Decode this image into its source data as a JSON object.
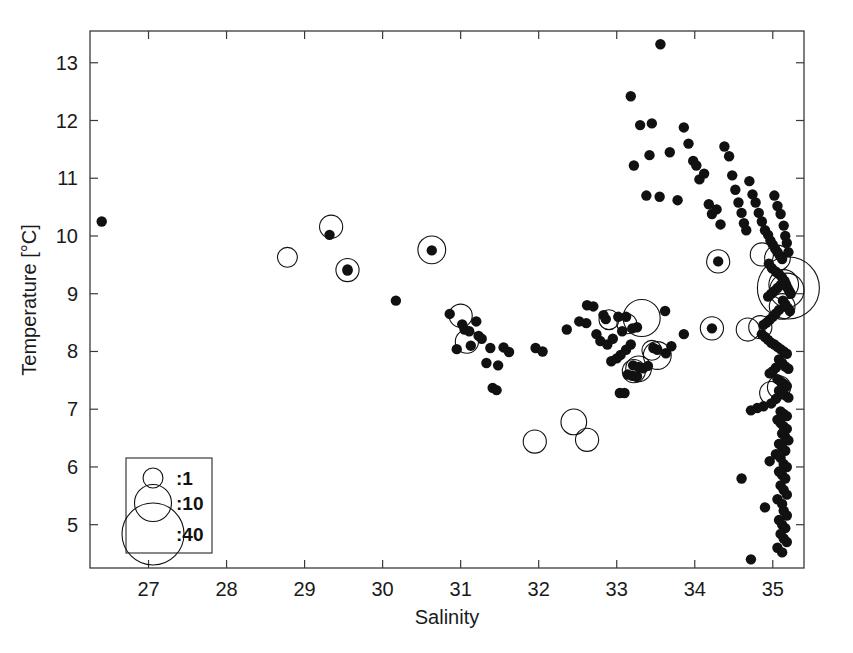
{
  "chart_data": {
    "type": "scatter",
    "title": "",
    "xlabel": "Salinity",
    "ylabel": "Temperature [°C]",
    "xlim": [
      26.25,
      35.4
    ],
    "ylim": [
      4.25,
      13.55
    ],
    "xticks": [
      27,
      28,
      29,
      30,
      31,
      32,
      33,
      34,
      35
    ],
    "yticks": [
      5,
      6,
      7,
      8,
      9,
      10,
      11,
      12,
      13
    ],
    "xticklabels": [
      "27",
      "28",
      "29",
      "30",
      "31",
      "32",
      "33",
      "34",
      "35"
    ],
    "yticklabels": [
      "5",
      "6",
      "7",
      "8",
      "9",
      "10",
      "11",
      "12",
      "13"
    ],
    "grid": false,
    "legend": {
      "position": "lower-left",
      "title": "",
      "entries": [
        {
          "label": ":1",
          "size_value": 1,
          "marker": "open-circle"
        },
        {
          "label": ":10",
          "size_value": 10,
          "marker": "open-circle"
        },
        {
          "label": ":40",
          "size_value": 40,
          "marker": "open-circle"
        }
      ]
    },
    "series": [
      {
        "name": "filled-observations",
        "marker": "filled-circle",
        "color": "#111111",
        "points": [
          [
            26.4,
            10.25
          ],
          [
            29.32,
            10.02
          ],
          [
            29.55,
            9.4
          ],
          [
            29.55,
            9.42
          ],
          [
            30.17,
            8.88
          ],
          [
            30.63,
            9.75
          ],
          [
            30.86,
            8.65
          ],
          [
            31.02,
            8.47
          ],
          [
            31.05,
            8.38
          ],
          [
            31.13,
            8.1
          ],
          [
            31.23,
            8.27
          ],
          [
            31.27,
            8.22
          ],
          [
            31.2,
            8.52
          ],
          [
            31.11,
            8.35
          ],
          [
            31.38,
            8.06
          ],
          [
            31.33,
            7.8
          ],
          [
            31.48,
            7.76
          ],
          [
            31.41,
            7.37
          ],
          [
            31.46,
            7.33
          ],
          [
            30.95,
            8.04
          ],
          [
            31.55,
            8.07
          ],
          [
            31.62,
            7.99
          ],
          [
            31.96,
            8.06
          ],
          [
            32.05,
            8.0
          ],
          [
            32.36,
            8.38
          ],
          [
            32.52,
            8.52
          ],
          [
            32.61,
            8.49
          ],
          [
            32.83,
            8.63
          ],
          [
            32.86,
            8.56
          ],
          [
            32.74,
            8.3
          ],
          [
            32.79,
            8.18
          ],
          [
            32.88,
            8.12
          ],
          [
            32.95,
            8.22
          ],
          [
            33.02,
            8.6
          ],
          [
            33.12,
            8.6
          ],
          [
            33.07,
            8.35
          ],
          [
            33.2,
            8.4
          ],
          [
            33.26,
            8.42
          ],
          [
            33.18,
            8.12
          ],
          [
            33.12,
            8.03
          ],
          [
            33.05,
            7.94
          ],
          [
            33.0,
            7.88
          ],
          [
            32.93,
            7.83
          ],
          [
            33.21,
            7.76
          ],
          [
            33.28,
            7.73
          ],
          [
            33.34,
            7.71
          ],
          [
            33.4,
            7.75
          ],
          [
            33.47,
            8.06
          ],
          [
            33.52,
            8.03
          ],
          [
            33.63,
            7.97
          ],
          [
            33.7,
            8.09
          ],
          [
            33.14,
            7.6
          ],
          [
            33.2,
            7.58
          ],
          [
            33.26,
            7.57
          ],
          [
            33.04,
            7.28
          ],
          [
            33.1,
            7.28
          ],
          [
            33.18,
            12.42
          ],
          [
            33.3,
            11.92
          ],
          [
            33.22,
            11.22
          ],
          [
            33.56,
            13.32
          ],
          [
            33.45,
            11.95
          ],
          [
            33.42,
            11.4
          ],
          [
            33.38,
            10.7
          ],
          [
            33.55,
            10.68
          ],
          [
            33.68,
            11.45
          ],
          [
            33.78,
            10.62
          ],
          [
            33.86,
            11.88
          ],
          [
            33.92,
            11.6
          ],
          [
            33.98,
            11.3
          ],
          [
            34.02,
            11.22
          ],
          [
            34.06,
            10.98
          ],
          [
            34.12,
            11.08
          ],
          [
            34.18,
            10.55
          ],
          [
            34.22,
            10.38
          ],
          [
            34.28,
            10.46
          ],
          [
            34.33,
            10.2
          ],
          [
            34.38,
            11.55
          ],
          [
            34.44,
            11.38
          ],
          [
            34.48,
            11.05
          ],
          [
            34.52,
            10.8
          ],
          [
            34.56,
            10.58
          ],
          [
            34.6,
            10.4
          ],
          [
            34.63,
            10.22
          ],
          [
            34.66,
            10.1
          ],
          [
            34.7,
            10.95
          ],
          [
            34.74,
            10.72
          ],
          [
            34.78,
            10.58
          ],
          [
            34.82,
            10.4
          ],
          [
            34.86,
            10.25
          ],
          [
            34.9,
            10.1
          ],
          [
            34.94,
            10.02
          ],
          [
            34.97,
            9.92
          ],
          [
            35.0,
            9.85
          ],
          [
            35.03,
            9.78
          ],
          [
            35.06,
            9.72
          ],
          [
            35.09,
            9.66
          ],
          [
            35.12,
            9.6
          ],
          [
            35.02,
            10.7
          ],
          [
            35.06,
            10.52
          ],
          [
            35.1,
            10.38
          ],
          [
            35.14,
            10.18
          ],
          [
            35.16,
            10.0
          ],
          [
            35.18,
            9.88
          ],
          [
            35.2,
            9.72
          ],
          [
            34.95,
            9.52
          ],
          [
            34.99,
            9.44
          ],
          [
            35.04,
            9.38
          ],
          [
            35.08,
            9.34
          ],
          [
            35.12,
            9.28
          ],
          [
            35.15,
            9.22
          ],
          [
            35.17,
            9.16
          ],
          [
            35.19,
            9.1
          ],
          [
            35.21,
            9.05
          ],
          [
            35.23,
            9.0
          ],
          [
            35.1,
            9.15
          ],
          [
            35.06,
            9.1
          ],
          [
            35.02,
            9.05
          ],
          [
            34.98,
            9.0
          ],
          [
            34.94,
            8.95
          ],
          [
            35.13,
            8.88
          ],
          [
            35.16,
            8.82
          ],
          [
            35.19,
            8.76
          ],
          [
            35.22,
            8.7
          ],
          [
            35.08,
            8.72
          ],
          [
            35.04,
            8.66
          ],
          [
            35.0,
            8.6
          ],
          [
            34.96,
            8.55
          ],
          [
            34.92,
            8.5
          ],
          [
            34.88,
            8.46
          ],
          [
            34.86,
            8.3
          ],
          [
            34.9,
            8.25
          ],
          [
            34.94,
            8.2
          ],
          [
            34.98,
            8.15
          ],
          [
            35.02,
            8.12
          ],
          [
            35.06,
            8.08
          ],
          [
            35.1,
            8.04
          ],
          [
            35.14,
            8.0
          ],
          [
            35.18,
            7.96
          ],
          [
            35.08,
            7.86
          ],
          [
            35.12,
            7.8
          ],
          [
            35.16,
            7.74
          ],
          [
            35.2,
            7.7
          ],
          [
            35.04,
            7.72
          ],
          [
            35.0,
            7.66
          ],
          [
            34.96,
            7.62
          ],
          [
            35.06,
            7.52
          ],
          [
            35.1,
            7.48
          ],
          [
            35.14,
            7.44
          ],
          [
            35.18,
            7.4
          ],
          [
            35.08,
            7.32
          ],
          [
            35.12,
            7.28
          ],
          [
            35.16,
            7.24
          ],
          [
            35.2,
            7.2
          ],
          [
            35.04,
            7.18
          ],
          [
            34.98,
            7.1
          ],
          [
            34.88,
            7.05
          ],
          [
            34.8,
            7.02
          ],
          [
            34.72,
            6.98
          ],
          [
            35.1,
            6.96
          ],
          [
            35.14,
            6.92
          ],
          [
            35.18,
            6.88
          ],
          [
            35.06,
            6.82
          ],
          [
            35.1,
            6.76
          ],
          [
            35.14,
            6.7
          ],
          [
            35.18,
            6.66
          ],
          [
            35.12,
            6.58
          ],
          [
            35.16,
            6.52
          ],
          [
            35.2,
            6.46
          ],
          [
            35.08,
            6.4
          ],
          [
            35.12,
            6.34
          ],
          [
            35.16,
            6.28
          ],
          [
            35.04,
            6.22
          ],
          [
            35.1,
            6.16
          ],
          [
            34.96,
            6.1
          ],
          [
            35.14,
            6.05
          ],
          [
            35.18,
            6.0
          ],
          [
            35.08,
            5.92
          ],
          [
            35.12,
            5.86
          ],
          [
            35.16,
            5.8
          ],
          [
            34.6,
            5.8
          ],
          [
            35.1,
            5.68
          ],
          [
            35.14,
            5.6
          ],
          [
            35.18,
            5.52
          ],
          [
            35.06,
            5.44
          ],
          [
            35.12,
            5.36
          ],
          [
            34.9,
            5.3
          ],
          [
            35.14,
            5.24
          ],
          [
            35.18,
            5.16
          ],
          [
            35.08,
            5.08
          ],
          [
            35.12,
            5.0
          ],
          [
            35.16,
            4.94
          ],
          [
            35.1,
            4.84
          ],
          [
            35.14,
            4.76
          ],
          [
            35.18,
            4.7
          ],
          [
            34.72,
            4.4
          ],
          [
            35.06,
            4.6
          ],
          [
            35.12,
            4.52
          ],
          [
            32.62,
            8.8
          ],
          [
            32.7,
            8.78
          ],
          [
            33.62,
            8.7
          ],
          [
            33.86,
            8.3
          ],
          [
            34.3,
            9.56
          ],
          [
            34.22,
            8.4
          ]
        ]
      },
      {
        "name": "sized-observations",
        "marker": "open-circle",
        "color": "#111111",
        "points": [
          [
            28.78,
            9.63,
            1
          ],
          [
            29.34,
            10.16,
            2
          ],
          [
            29.55,
            9.41,
            2
          ],
          [
            30.63,
            9.76,
            4
          ],
          [
            31.0,
            8.62,
            2
          ],
          [
            31.08,
            8.17,
            2
          ],
          [
            31.95,
            6.44,
            2
          ],
          [
            32.45,
            6.78,
            3
          ],
          [
            32.62,
            6.47,
            2
          ],
          [
            32.9,
            8.55,
            1
          ],
          [
            33.13,
            8.48,
            1
          ],
          [
            33.32,
            8.58,
            10
          ],
          [
            33.45,
            8.02,
            1
          ],
          [
            33.52,
            7.93,
            4
          ],
          [
            33.28,
            7.7,
            3
          ],
          [
            33.22,
            7.66,
            2
          ],
          [
            34.3,
            9.56,
            2
          ],
          [
            34.22,
            8.4,
            2
          ],
          [
            34.68,
            8.38,
            2
          ],
          [
            35.2,
            9.1,
            40
          ],
          [
            35.18,
            9.06,
            8
          ],
          [
            35.14,
            9.16,
            5
          ],
          [
            35.06,
            9.62,
            3
          ],
          [
            34.86,
            9.68,
            2
          ],
          [
            34.84,
            8.42,
            2
          ],
          [
            35.12,
            8.78,
            3
          ],
          [
            35.08,
            7.38,
            2
          ],
          [
            34.98,
            7.28,
            2
          ]
        ]
      }
    ]
  }
}
